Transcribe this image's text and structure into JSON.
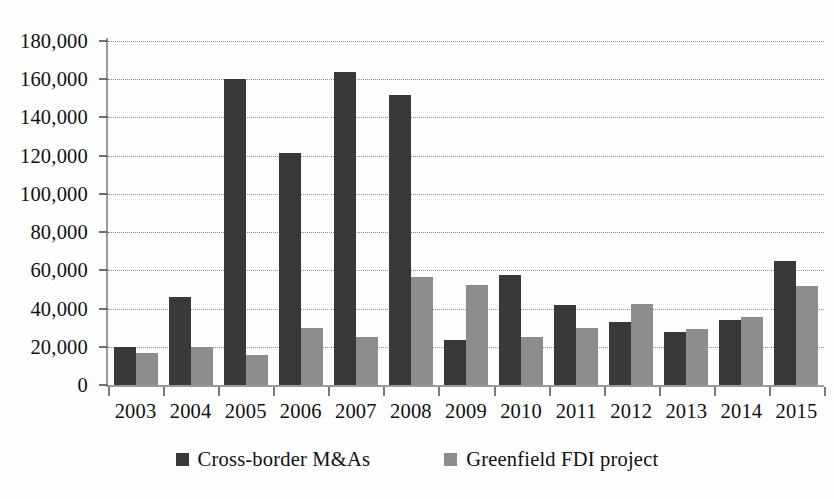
{
  "chart_data": {
    "type": "bar",
    "title": "",
    "subtitle": "",
    "xlabel": "",
    "ylabel": "",
    "categories": [
      "2003",
      "2004",
      "2005",
      "2006",
      "2007",
      "2008",
      "2009",
      "2010",
      "2011",
      "2012",
      "2013",
      "2014",
      "2015"
    ],
    "series": [
      {
        "name": "Cross-border M&As",
        "color": "#393939",
        "values": [
          20000,
          46000,
          160000,
          121500,
          164000,
          152000,
          23500,
          57500,
          42000,
          33000,
          28000,
          34000,
          65000
        ]
      },
      {
        "name": "Greenfield FDI project",
        "color": "#8d8d8d",
        "values": [
          17000,
          20000,
          15500,
          30000,
          25000,
          56500,
          52500,
          25000,
          30000,
          42500,
          29500,
          35500,
          52000
        ]
      }
    ],
    "ylim": [
      0,
      180000
    ],
    "ytick_values": [
      0,
      20000,
      40000,
      60000,
      80000,
      100000,
      120000,
      140000,
      160000,
      180000
    ],
    "ytick_labels": [
      "0",
      "20,000",
      "40,000",
      "60,000",
      "80,000",
      "100,000",
      "120,000",
      "140,000",
      "160,000",
      "180,000"
    ],
    "grid": true,
    "grid_style": "dotted-horizontal",
    "legend_position": "bottom-center",
    "legend_entries": [
      "Cross-border M&As",
      "Greenfield FDI project"
    ]
  },
  "colors": {
    "series_0": "#393939",
    "series_1": "#8d8d8d",
    "gridline": "#8d8d8d",
    "axis": "#9a9a9a",
    "text": "#101010",
    "background": "#fefefe"
  }
}
